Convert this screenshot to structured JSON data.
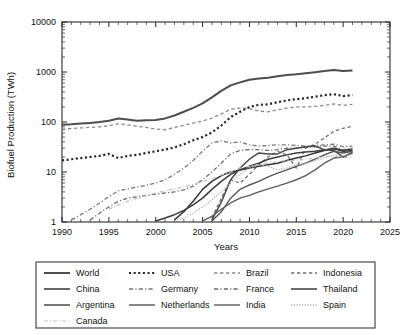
{
  "chart_data": {
    "type": "line",
    "title": "",
    "xlabel": "Years",
    "ylabel": "Biofuel Production (TWh)",
    "xlim": [
      1990,
      2025
    ],
    "ylim": [
      1,
      10000
    ],
    "yscale": "log",
    "grid": false,
    "legend_position": "bottom",
    "xticks": [
      1990,
      1995,
      2000,
      2005,
      2010,
      2015,
      2020,
      2025
    ],
    "xtick_labels": [
      "1990",
      "1995",
      "2000",
      "2005",
      "2010",
      "2015",
      "2020",
      "2025"
    ],
    "yticks": [
      1,
      10,
      100,
      1000,
      10000
    ],
    "ytick_labels": [
      "1",
      "10",
      "100",
      "1000",
      "10000"
    ],
    "series": [
      {
        "name": "World",
        "style": "solid",
        "width": 2.0,
        "color": "#4d4d4d",
        "x": [
          1990,
          1991,
          1992,
          1993,
          1994,
          1995,
          1996,
          1997,
          1998,
          1999,
          2000,
          2001,
          2002,
          2003,
          2004,
          2005,
          2006,
          2007,
          2008,
          2009,
          2010,
          2011,
          2012,
          2013,
          2014,
          2015,
          2016,
          2017,
          2018,
          2019,
          2020,
          2021
        ],
        "values": [
          88,
          90,
          93,
          96,
          100,
          106,
          118,
          112,
          106,
          108,
          110,
          118,
          135,
          160,
          192,
          235,
          310,
          420,
          540,
          620,
          700,
          740,
          770,
          820,
          870,
          900,
          940,
          990,
          1050,
          1100,
          1050,
          1075
        ]
      },
      {
        "name": "USA",
        "style": "dotted",
        "width": 2.2,
        "color": "#262626",
        "x": [
          1990,
          1991,
          1992,
          1993,
          1994,
          1995,
          1996,
          1997,
          1998,
          1999,
          2000,
          2001,
          2002,
          2003,
          2004,
          2005,
          2006,
          2007,
          2008,
          2009,
          2010,
          2011,
          2012,
          2013,
          2014,
          2015,
          2016,
          2017,
          2018,
          2019,
          2020,
          2021
        ],
        "values": [
          17,
          18,
          19,
          20,
          21,
          23,
          19,
          21,
          22,
          24,
          26,
          28,
          31,
          36,
          43,
          50,
          62,
          85,
          125,
          160,
          200,
          220,
          225,
          250,
          270,
          285,
          300,
          320,
          345,
          360,
          330,
          345
        ]
      },
      {
        "name": "Brazil",
        "style": "dashed",
        "width": 1.3,
        "color": "#8c8c8c",
        "x": [
          1990,
          1991,
          1992,
          1993,
          1994,
          1995,
          1996,
          1997,
          1998,
          1999,
          2000,
          2001,
          2002,
          2003,
          2004,
          2005,
          2006,
          2007,
          2008,
          2009,
          2010,
          2011,
          2012,
          2013,
          2014,
          2015,
          2016,
          2017,
          2018,
          2019,
          2020,
          2021
        ],
        "values": [
          72,
          74,
          76,
          78,
          80,
          84,
          92,
          88,
          82,
          78,
          72,
          70,
          78,
          86,
          95,
          105,
          120,
          145,
          180,
          190,
          185,
          165,
          160,
          175,
          190,
          200,
          200,
          205,
          215,
          230,
          215,
          225
        ]
      },
      {
        "name": "Indonesia",
        "style": "dashed",
        "width": 1.3,
        "color": "#707070",
        "x": [
          2006,
          2007,
          2008,
          2009,
          2010,
          2011,
          2012,
          2013,
          2014,
          2015,
          2016,
          2017,
          2018,
          2019,
          2020,
          2021
        ],
        "values": [
          1.2,
          3,
          7,
          6,
          9,
          14,
          20,
          26,
          22,
          12,
          30,
          36,
          48,
          65,
          75,
          82
        ]
      },
      {
        "name": "China",
        "style": "solid",
        "width": 1.5,
        "color": "#333333",
        "x": [
          2002,
          2003,
          2004,
          2005,
          2006,
          2007,
          2008,
          2009,
          2010,
          2011,
          2012,
          2013,
          2014,
          2015,
          2016,
          2017,
          2018,
          2019,
          2020,
          2021
        ],
        "values": [
          1.1,
          1.6,
          2.6,
          4.5,
          6.5,
          8.5,
          10,
          11,
          12,
          13,
          14,
          15,
          17,
          19,
          21,
          24,
          27,
          30,
          27,
          29
        ]
      },
      {
        "name": "Germany",
        "style": "dashdot",
        "width": 1.3,
        "color": "#777777",
        "x": [
          1991,
          1992,
          1993,
          1994,
          1995,
          1996,
          1997,
          1998,
          1999,
          2000,
          2001,
          2002,
          2003,
          2004,
          2005,
          2006,
          2007,
          2008,
          2009,
          2010,
          2011,
          2012,
          2013,
          2014,
          2015,
          2016,
          2017,
          2018,
          2019,
          2020,
          2021
        ],
        "values": [
          1.1,
          1.4,
          1.8,
          2.4,
          3.2,
          4.2,
          4.6,
          5.0,
          5.4,
          6.0,
          7.0,
          9.0,
          12,
          17,
          26,
          38,
          42,
          38,
          40,
          35,
          33,
          34,
          35,
          35,
          34,
          33,
          34,
          35,
          36,
          32,
          33
        ]
      },
      {
        "name": "France",
        "style": "dashdot",
        "width": 1.3,
        "color": "#6b6b6b",
        "x": [
          1993,
          1994,
          1995,
          1996,
          1997,
          1998,
          1999,
          2000,
          2001,
          2002,
          2003,
          2004,
          2005,
          2006,
          2007,
          2008,
          2009,
          2010,
          2011,
          2012,
          2013,
          2014,
          2015,
          2016,
          2017,
          2018,
          2019,
          2020,
          2021
        ],
        "values": [
          1.1,
          1.5,
          2.0,
          2.6,
          3.0,
          3.2,
          3.4,
          3.6,
          3.8,
          4.0,
          4.4,
          5.2,
          7.0,
          10,
          15,
          23,
          27,
          28,
          28,
          27,
          28,
          30,
          30,
          31,
          32,
          33,
          33,
          28,
          30
        ]
      },
      {
        "name": "Thailand",
        "style": "solid",
        "width": 1.5,
        "color": "#3d3d3d",
        "x": [
          2000,
          2001,
          2002,
          2003,
          2004,
          2005,
          2006,
          2007,
          2008,
          2009,
          2010,
          2011,
          2012,
          2013,
          2014,
          2015,
          2016,
          2017,
          2018,
          2019,
          2020,
          2021
        ],
        "values": [
          1.05,
          1.2,
          1.4,
          1.7,
          2.2,
          3.0,
          4.5,
          6.5,
          9.0,
          11,
          13,
          15,
          18,
          20,
          22,
          24,
          25,
          26,
          28,
          29,
          26,
          27
        ]
      },
      {
        "name": "Argentina",
        "style": "solid",
        "width": 1.5,
        "color": "#4a4a4a",
        "x": [
          2006,
          2007,
          2008,
          2009,
          2010,
          2011,
          2012,
          2013,
          2014,
          2015,
          2016,
          2017,
          2018,
          2019,
          2020,
          2021
        ],
        "values": [
          1.1,
          2.5,
          7,
          12,
          18,
          24,
          23,
          23,
          28,
          30,
          32,
          33,
          28,
          27,
          20,
          24
        ]
      },
      {
        "name": "Netherlands",
        "style": "solid",
        "width": 1.4,
        "color": "#555555",
        "x": [
          2006,
          2007,
          2008,
          2009,
          2010,
          2011,
          2012,
          2013,
          2014,
          2015,
          2016,
          2017,
          2018,
          2019,
          2020,
          2021
        ],
        "values": [
          1.05,
          1.6,
          3.0,
          4.5,
          5.5,
          6.5,
          8.0,
          9.5,
          11,
          13,
          15,
          18,
          22,
          26,
          24,
          26
        ]
      },
      {
        "name": "India",
        "style": "solid",
        "width": 1.4,
        "color": "#5c5c5c",
        "x": [
          2005,
          2006,
          2007,
          2008,
          2009,
          2010,
          2011,
          2012,
          2013,
          2014,
          2015,
          2016,
          2017,
          2018,
          2019,
          2020,
          2021
        ],
        "values": [
          1.05,
          1.3,
          1.8,
          2.4,
          3.0,
          3.4,
          4.0,
          4.6,
          5.2,
          6.0,
          7.0,
          8.5,
          11,
          15,
          19,
          20,
          25
        ]
      },
      {
        "name": "Spain",
        "style": "dotted",
        "width": 1.3,
        "color": "#b0b0b0",
        "x": [
          2002,
          2003,
          2004,
          2005,
          2006,
          2007,
          2008,
          2009,
          2010,
          2011,
          2012,
          2013,
          2014,
          2015,
          2016,
          2017,
          2018,
          2019,
          2020,
          2021
        ],
        "values": [
          1.05,
          1.2,
          1.5,
          2.0,
          2.8,
          4.0,
          6.0,
          9.0,
          12,
          14,
          13,
          11,
          12,
          14,
          15,
          17,
          19,
          22,
          21,
          23
        ]
      },
      {
        "name": "Canada",
        "style": "dashdot",
        "width": 1.2,
        "color": "#c0c0c0",
        "x": [
          1995,
          1996,
          1997,
          1998,
          1999,
          2000,
          2001,
          2002,
          2003,
          2004,
          2005,
          2006,
          2007,
          2008,
          2009,
          2010,
          2011,
          2012,
          2013,
          2014,
          2015,
          2016,
          2017,
          2018,
          2019,
          2020,
          2021
        ],
        "values": [
          1.8,
          2.2,
          2.6,
          3.0,
          3.4,
          3.8,
          4.2,
          4.6,
          5.0,
          5.6,
          6.4,
          7.4,
          8.6,
          10,
          12,
          13,
          14,
          15,
          16,
          17,
          17,
          18,
          19,
          20,
          21,
          19,
          20
        ]
      }
    ]
  },
  "legend": {
    "entries": [
      {
        "label": "World",
        "style": "solid",
        "width": 2.0,
        "color": "#4d4d4d"
      },
      {
        "label": "USA",
        "style": "dotted",
        "width": 2.2,
        "color": "#262626"
      },
      {
        "label": "Brazil",
        "style": "dashed",
        "width": 1.3,
        "color": "#8c8c8c"
      },
      {
        "label": "Indonesia",
        "style": "dashed",
        "width": 1.3,
        "color": "#707070"
      },
      {
        "label": "China",
        "style": "solid",
        "width": 1.5,
        "color": "#333333"
      },
      {
        "label": "Germany",
        "style": "dashdot",
        "width": 1.3,
        "color": "#777777"
      },
      {
        "label": "France",
        "style": "dashdot",
        "width": 1.3,
        "color": "#6b6b6b"
      },
      {
        "label": "Thailand",
        "style": "solid",
        "width": 1.5,
        "color": "#3d3d3d"
      },
      {
        "label": "Argentina",
        "style": "solid",
        "width": 1.5,
        "color": "#4a4a4a"
      },
      {
        "label": "Netherlands",
        "style": "solid",
        "width": 1.4,
        "color": "#555555"
      },
      {
        "label": "India",
        "style": "solid",
        "width": 1.4,
        "color": "#5c5c5c"
      },
      {
        "label": "Spain",
        "style": "dotted",
        "width": 1.3,
        "color": "#b0b0b0"
      },
      {
        "label": "Canada",
        "style": "dashdot",
        "width": 1.2,
        "color": "#c0c0c0"
      }
    ]
  }
}
